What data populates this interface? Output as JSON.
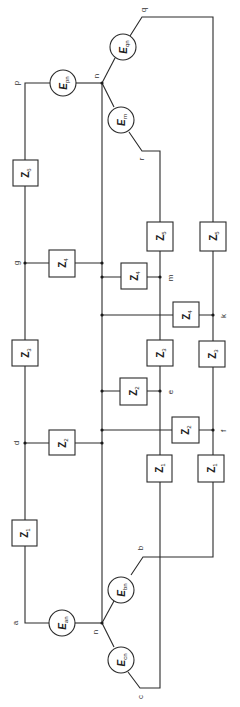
{
  "diagram": {
    "title": "",
    "orientation": "rotated -90deg",
    "colors": {
      "line": "#2a2a2a",
      "text": "#222222",
      "background": "#ffffff"
    },
    "nodes": {
      "a": "a",
      "b": "b",
      "c": "c",
      "d": "d",
      "e": "e",
      "f": "f",
      "g": "g",
      "k": "k",
      "m": "m",
      "n_bottom": "n",
      "n_top": "n",
      "p": "p",
      "q": "q",
      "r": "r"
    },
    "sources": {
      "ean": {
        "main": "E",
        "sub": "an"
      },
      "ebn": {
        "main": "E",
        "sub": "bn"
      },
      "ecn": {
        "main": "E",
        "sub": "cn"
      },
      "epn": {
        "main": "E",
        "sub": "pn"
      },
      "eqn": {
        "main": "E",
        "sub": "qn"
      },
      "ern": {
        "main": "E",
        "sub": "rn"
      }
    },
    "impedances": {
      "left_z1": {
        "main": "Z",
        "sub": "1"
      },
      "left_z2": {
        "main": "Z",
        "sub": "2"
      },
      "left_z3": {
        "main": "Z",
        "sub": "3"
      },
      "left_z4": {
        "main": "Z",
        "sub": "4"
      },
      "left_z6": {
        "main": "Z",
        "sub": "6"
      },
      "mid_z1": {
        "main": "Z",
        "sub": "1"
      },
      "mid_z2": {
        "main": "Z",
        "sub": "2"
      },
      "mid_z3": {
        "main": "Z",
        "sub": "3"
      },
      "mid_z4": {
        "main": "Z",
        "sub": "4"
      },
      "mid_z5": {
        "main": "Z",
        "sub": "5"
      },
      "right_z1": {
        "main": "Z",
        "sub": "1"
      },
      "right_z2": {
        "main": "Z",
        "sub": "2"
      },
      "right_z3": {
        "main": "Z",
        "sub": "3"
      },
      "right_z4": {
        "main": "Z",
        "sub": "4"
      },
      "right_z5": {
        "main": "Z",
        "sub": "5"
      }
    }
  }
}
